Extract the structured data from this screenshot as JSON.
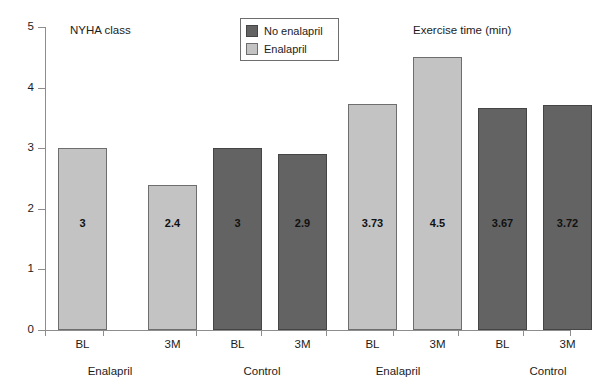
{
  "chart_data": {
    "type": "bar",
    "title": "",
    "xlabel": "",
    "ylabel": "",
    "ylim": [
      0,
      5
    ],
    "yticks": [
      "0",
      "1",
      "2",
      "3",
      "4",
      "5"
    ],
    "grid": false,
    "legend": {
      "position": "top-center",
      "entries": [
        {
          "name": "No enalapril",
          "color": "#636363"
        },
        {
          "name": "Enalapril",
          "color": "#c3c3c3"
        }
      ]
    },
    "panels": [
      {
        "title": "NYHA class",
        "groups": [
          "Enalapril",
          "Control"
        ],
        "categories": [
          "BL",
          "3M",
          "BL",
          "3M"
        ],
        "series": [
          {
            "name": "Enalapril",
            "color": "#c3c3c3"
          },
          {
            "name": "No enalapril",
            "color": "#636363"
          }
        ],
        "bars": [
          {
            "group": "Enalapril",
            "category": "BL",
            "value": 3,
            "label": "3",
            "series": "Enalapril"
          },
          {
            "group": "Enalapril",
            "category": "3M",
            "value": 2.4,
            "label": "2.4",
            "series": "Enalapril"
          },
          {
            "group": "Control",
            "category": "BL",
            "value": 3,
            "label": "3",
            "series": "No enalapril"
          },
          {
            "group": "Control",
            "category": "3M",
            "value": 2.9,
            "label": "2.9",
            "series": "No enalapril"
          }
        ]
      },
      {
        "title": "Exercise time (min)",
        "groups": [
          "Enalapril",
          "Control"
        ],
        "categories": [
          "BL",
          "3M",
          "BL",
          "3M"
        ],
        "series": [
          {
            "name": "Enalapril",
            "color": "#c3c3c3"
          },
          {
            "name": "No enalapril",
            "color": "#636363"
          }
        ],
        "bars": [
          {
            "group": "Enalapril",
            "category": "BL",
            "value": 3.73,
            "label": "3.73",
            "series": "Enalapril"
          },
          {
            "group": "Enalapril",
            "category": "3M",
            "value": 4.5,
            "label": "4.5",
            "series": "Enalapril"
          },
          {
            "group": "Control",
            "category": "BL",
            "value": 3.67,
            "label": "3.67",
            "series": "No enalapril"
          },
          {
            "group": "Control",
            "category": "3M",
            "value": 3.72,
            "label": "3.72",
            "series": "No enalapril"
          }
        ]
      }
    ]
  },
  "colors": {
    "dark": "#636363",
    "light": "#c3c3c3",
    "axis": "#8d8d8d",
    "text": "#1c1c1c"
  }
}
